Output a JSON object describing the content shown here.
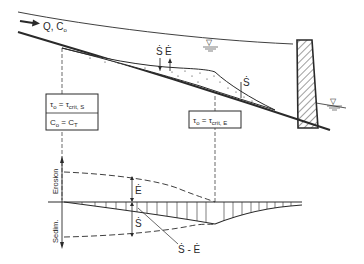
{
  "figure": {
    "type": "hydraulic-sedimentation-diagram",
    "colors": {
      "ink": "#2a2a2a",
      "background": "#ffffff"
    }
  },
  "upper_section": {
    "inflow_label": "Q, C",
    "inflow_subscript": "o",
    "deposition_label": "Ṡ",
    "erosion_label": "Ė",
    "deposition_label_right": "Ṡ",
    "water_level_symbol": "▽",
    "box_left": {
      "row1": {
        "lhs": "τ",
        "lhs_sub": "o",
        "eq": " = τ",
        "rhs_sub": "crit, S"
      },
      "row2": {
        "lhs": "C",
        "lhs_sub": "o",
        "eq": " = C",
        "rhs_sub": "T"
      }
    },
    "box_right": {
      "row1": {
        "lhs": "τ",
        "lhs_sub": "o",
        "eq": " = τ",
        "rhs_sub": "crit, E"
      }
    }
  },
  "lower_section": {
    "axis_label_top": "Erosion",
    "axis_label_bottom": "Sedim.",
    "curve_label_E": "Ė",
    "curve_label_S": "Ṡ",
    "curve_label_net": "Ṡ - Ė"
  }
}
